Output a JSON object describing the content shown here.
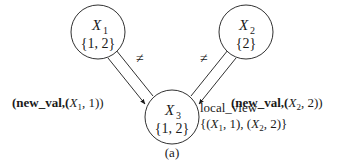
{
  "nodes": [
    {
      "id": "X1",
      "var": "X",
      "sub": "1",
      "domain": "{1, 2}"
    },
    {
      "id": "X2",
      "var": "X",
      "sub": "2",
      "domain": "{2}"
    },
    {
      "id": "X3",
      "var": "X",
      "sub": "3",
      "domain": "{1, 2}"
    }
  ],
  "edges": [
    {
      "from": "X1",
      "to": "X3",
      "constraint": "≠",
      "message": {
        "open": "(",
        "name": "new_val",
        "comma": ",(",
        "var": "X",
        "sub": "1",
        "val": ", 1))"
      }
    },
    {
      "from": "X2",
      "to": "X3",
      "constraint": "≠",
      "message": {
        "open": "(",
        "name": "new_val",
        "comma": ",(",
        "var": "X",
        "sub": "2",
        "val": ", 2))"
      }
    }
  ],
  "local_view": {
    "label": "local_view",
    "p1": "{(",
    "v1": "X",
    "s1": "1",
    "m1": ", 1), (",
    "v2": "X",
    "s2": "2",
    "m2": ", 2)}"
  },
  "caption": "(a)"
}
